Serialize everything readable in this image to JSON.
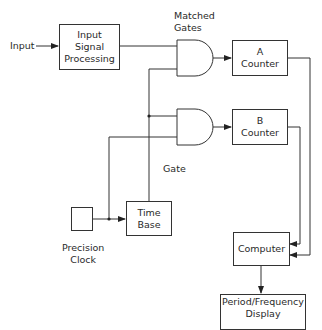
{
  "diagram": {
    "type": "block-diagram",
    "blocks": {
      "input_signal_processing": {
        "line1": "Input",
        "line2": "Signal",
        "line3": "Processing"
      },
      "a_counter": {
        "line1": "A",
        "line2": "Counter"
      },
      "b_counter": {
        "line1": "B",
        "line2": "Counter"
      },
      "time_base": {
        "line1": "Time",
        "line2": "Base"
      },
      "computer": {
        "label": "Computer"
      },
      "display": {
        "line1": "Period/Frequency",
        "line2": "Display"
      },
      "precision_clock": {
        "line1": "Precision",
        "line2": "Clock"
      }
    },
    "labels": {
      "input": "Input",
      "matched_gates_line1": "Matched",
      "matched_gates_line2": "Gates",
      "gate": "Gate"
    },
    "connections": [
      {
        "from": "Input",
        "to": "Input Signal Processing"
      },
      {
        "from": "Input Signal Processing",
        "to": "Gate A (upper input)"
      },
      {
        "from": "Time Base",
        "to": "Gate A (lower input)",
        "label": "Gate"
      },
      {
        "from": "Time Base",
        "to": "Gate B (upper input)",
        "label": "Gate"
      },
      {
        "from": "Precision Clock",
        "to": "Gate B (lower input)"
      },
      {
        "from": "Precision Clock",
        "to": "Time Base"
      },
      {
        "from": "Gate A",
        "to": "A Counter"
      },
      {
        "from": "Gate B",
        "to": "B Counter"
      },
      {
        "from": "A Counter",
        "to": "Computer"
      },
      {
        "from": "B Counter",
        "to": "Computer"
      },
      {
        "from": "Computer",
        "to": "Period/Frequency Display"
      }
    ]
  }
}
